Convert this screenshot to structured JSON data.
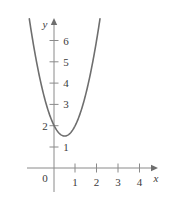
{
  "figure": {
    "kind": "cartesian-plot",
    "background_color": "#ffffff",
    "curve_color": "#6e6e6e",
    "axis_color": "#8a8a8a",
    "label_color": "#3b3b3b"
  },
  "axes": {
    "x_axis_label": "x",
    "y_axis_label": "y",
    "origin_label": "0",
    "x_ticks": [
      "1",
      "2",
      "3",
      "4"
    ],
    "y_ticks": [
      "1",
      "2",
      "3",
      "4",
      "5",
      "6"
    ]
  },
  "chart_data": {
    "type": "line",
    "title": "",
    "subtitle": "",
    "xlabel": "x",
    "ylabel": "y",
    "xlim": [
      -1.3,
      4.8
    ],
    "ylim": [
      -1.1,
      7.0
    ],
    "grid": false,
    "legend": null,
    "annotations": [],
    "xticks": [
      1,
      2,
      3,
      4
    ],
    "xticklabels": [
      "1",
      "2",
      "3",
      "4"
    ],
    "yticks": [
      1,
      2,
      3,
      4,
      5,
      6
    ],
    "yticklabels": [
      "1",
      "2",
      "3",
      "4",
      "5",
      "6"
    ],
    "origin_label": "0",
    "series": [
      {
        "name": "parabola",
        "equation": "y = 2x^2 - 2x + 2",
        "vertex": [
          0.5,
          1.5
        ],
        "y_intercept": 2,
        "color": "#6e6e6e",
        "x": [
          -1.25,
          -1.0,
          -0.75,
          -0.5,
          -0.25,
          0,
          0.25,
          0.5,
          0.75,
          1.0,
          1.25,
          1.5,
          1.75,
          2.0,
          2.25
        ],
        "values": [
          7.6,
          6.0,
          4.6,
          3.5,
          2.6,
          2.0,
          1.6,
          1.5,
          1.6,
          2.0,
          2.6,
          3.5,
          4.6,
          6.0,
          7.6
        ]
      }
    ]
  }
}
